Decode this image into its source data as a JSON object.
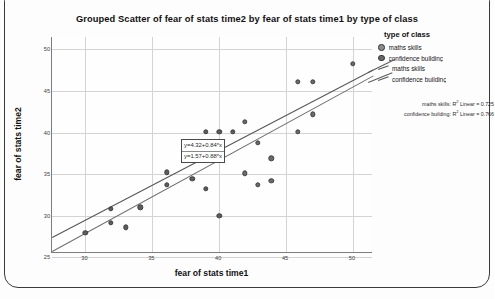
{
  "chart_data": {
    "type": "scatter",
    "title": "Grouped Scatter of fear of stats time2 by fear of stats time1 by type of class",
    "xlabel": "fear of stats time1",
    "ylabel": "fear of stats time2",
    "xlim": [
      27.5,
      51.5
    ],
    "ylim": [
      25.5,
      51.5
    ],
    "xticks": [
      "30",
      "35",
      "40",
      "45",
      "50"
    ],
    "xtick_values": [
      30,
      35,
      40,
      45,
      50
    ],
    "yticks": [
      "25",
      "30",
      "35",
      "40",
      "45",
      "50"
    ],
    "ytick_values": [
      25,
      30,
      35,
      40,
      45,
      50
    ],
    "grid": true,
    "legend_position": "right",
    "legend_title": "type of class",
    "series": [
      {
        "name": "maths skills",
        "points": [
          [
            30.0,
            27.9
          ],
          [
            31.9,
            29.1
          ],
          [
            31.9,
            30.8
          ],
          [
            33.0,
            28.6
          ],
          [
            34.1,
            31.0
          ],
          [
            36.1,
            35.2
          ],
          [
            36.1,
            33.7
          ],
          [
            38.0,
            34.4
          ],
          [
            39.0,
            33.2
          ],
          [
            39.0,
            40.1
          ],
          [
            40.0,
            30.0
          ],
          [
            40.0,
            40.1
          ],
          [
            41.0,
            40.1
          ]
        ]
      },
      {
        "name": "confidence building",
        "points": [
          [
            41.9,
            41.3
          ],
          [
            41.9,
            35.1
          ],
          [
            42.9,
            38.8
          ],
          [
            42.9,
            33.7
          ],
          [
            43.9,
            36.9
          ],
          [
            43.9,
            34.2
          ],
          [
            45.9,
            46.1
          ],
          [
            45.9,
            40.1
          ],
          [
            47.0,
            46.1
          ],
          [
            47.0,
            42.2
          ],
          [
            50.0,
            48.3
          ]
        ]
      }
    ],
    "fit_lines": [
      {
        "name": "maths skills",
        "equation": "y=4.32+0.84*x",
        "intercept": 4.32,
        "slope": 0.84
      },
      {
        "name": "confidence building",
        "equation": "y=1.57+0.88*x",
        "intercept": 1.57,
        "slope": 0.88
      }
    ],
    "annotations": {
      "r2_maths_prefix": "maths skills:",
      "r2_maths_label": "Linear = 0.725",
      "r2_maths_value": 0.725,
      "r2_confidence_prefix": "confidence building:",
      "r2_confidence_label": "Linear = 0.766",
      "r2_confidence_value": 0.766,
      "r2_symbol": "R",
      "r2_superscript": "2"
    }
  },
  "legend": {
    "title": "type of class",
    "entries": [
      {
        "label": "maths skills",
        "kind": "marker"
      },
      {
        "label": "confidence buildinç",
        "kind": "marker"
      },
      {
        "label": "maths skills",
        "kind": "line"
      },
      {
        "label": "confidence buildinç",
        "kind": "line"
      }
    ]
  }
}
